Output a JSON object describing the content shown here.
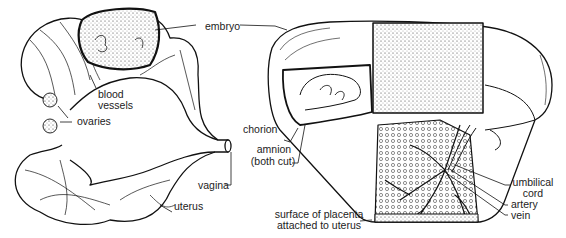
{
  "figure": {
    "left_panel": {
      "description": "Uterus with developing embryo",
      "labels": {
        "embryo": "embryo",
        "blood_vessels_1": "blood",
        "blood_vessels_2": "vessels",
        "ovaries": "ovaries",
        "vagina": "vagina",
        "uterus": "uterus"
      }
    },
    "right_panel": {
      "description": "Cut-away of embryo within membranes and placenta",
      "labels": {
        "chorion": "chorion",
        "amnion_1": "amnion",
        "amnion_2": "(both cut)",
        "placenta_1": "surface of placenta",
        "placenta_2": "attached to uterus",
        "umbilical_1": "umbilical",
        "umbilical_2": "cord",
        "artery": "artery",
        "vein": "vein"
      }
    }
  }
}
